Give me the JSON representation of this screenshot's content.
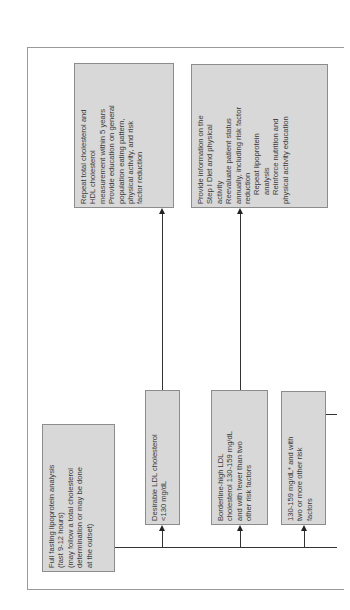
{
  "diagram": {
    "orientation": "rotated-90-ccw",
    "colors": {
      "box_fill": "#d8d8d8",
      "box_border": "#8c8c8c",
      "connector": "#333333",
      "frame": "#9a9a9a"
    },
    "start": {
      "lines": [
        "Full fasting lipoprotein analysis",
        "(fast 9-12 hours)",
        "(may follow a total cholesterol",
        "determination or may be done",
        "at the outset)"
      ]
    },
    "classifications": [
      {
        "lines": [
          "Desirable LDL cholesterol",
          "<130 mg/dL"
        ]
      },
      {
        "lines": [
          "Borderline-high LDL",
          "cholesterol 130-159 mg/dL",
          "and with fewer than two",
          "other risk factors"
        ]
      },
      {
        "lines": [
          "130-159 mg/dL* and with",
          "two or more other risk",
          "factors"
        ]
      }
    ],
    "actions": [
      {
        "lines": [
          {
            "text": "Repeat total cholesterol and",
            "indent": false
          },
          {
            "text": "HDL cholesterol",
            "indent": false
          },
          {
            "text": "measurement within 5 years",
            "indent": false
          },
          {
            "text": "Provide education on general",
            "indent": false
          },
          {
            "text": "population eating pattern,",
            "indent": false
          },
          {
            "text": "physical activity, and risk",
            "indent": false
          },
          {
            "text": "factor reduction",
            "indent": false
          }
        ]
      },
      {
        "lines": [
          {
            "text": "Provide information on the",
            "indent": false
          },
          {
            "text": "Step I Diet and physical",
            "indent": false
          },
          {
            "text": "activity",
            "indent": false
          },
          {
            "text": "Reevaluate patient status",
            "indent": false
          },
          {
            "text": "annually, including risk factor",
            "indent": false
          },
          {
            "text": "reduction",
            "indent": false
          },
          {
            "text": "Repeat lipoprotein",
            "indent": true
          },
          {
            "text": "analysis",
            "indent": true
          },
          {
            "text": "Reinforce nutrition and",
            "indent": true
          },
          {
            "text": "physical activity education",
            "indent": false
          }
        ]
      }
    ]
  }
}
